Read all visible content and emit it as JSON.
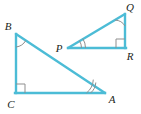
{
  "figure": {
    "background_color": "#ffffff",
    "stroke_color": "#4cbcd6",
    "mark_color": "#8a8a8a",
    "label_color": "#231f20",
    "stroke_width": 2.2,
    "width": 141,
    "height": 114
  },
  "triangles": [
    {
      "name": "triangle-abc",
      "vertices": [
        {
          "label": "B",
          "x": 16,
          "y": 34,
          "label_x": 8,
          "label_y": 30
        },
        {
          "label": "C",
          "x": 16,
          "y": 93,
          "label_x": 8,
          "label_y": 108
        },
        {
          "label": "A",
          "x": 105,
          "y": 93,
          "label_x": 108,
          "label_y": 103
        }
      ],
      "right_angle_at": "C",
      "arc_angle_at": "B",
      "tick_angle_at": "A",
      "tick_count": 2
    },
    {
      "name": "triangle-pqr",
      "vertices": [
        {
          "label": "P",
          "x": 68,
          "y": 48,
          "label_x": 56,
          "label_y": 52
        },
        {
          "label": "Q",
          "x": 125,
          "y": 14,
          "label_x": 127,
          "label_y": 11
        },
        {
          "label": "R",
          "x": 125,
          "y": 48,
          "label_x": 127,
          "label_y": 60
        }
      ],
      "right_angle_at": "R",
      "arc_angle_at": "Q",
      "tick_angle_at": "P",
      "tick_count": 2
    }
  ],
  "labels": {
    "B": "B",
    "C": "C",
    "A": "A",
    "P": "P",
    "Q": "Q",
    "R": "R"
  }
}
